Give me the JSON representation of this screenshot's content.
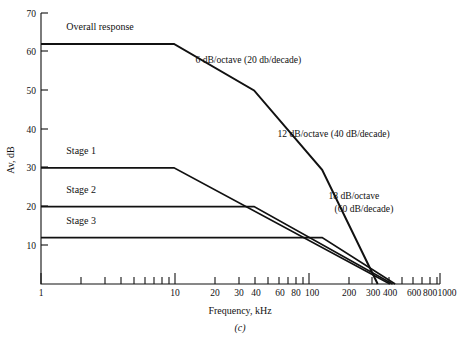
{
  "figure": {
    "caption": "(c)",
    "xlabel": "Frequency, kHz",
    "ylabel": "Av, dB"
  },
  "chart_data": {
    "type": "line",
    "title": "",
    "xlabel": "Frequency, kHz",
    "ylabel": "Av, dB",
    "xscale": "log",
    "xlim": [
      1,
      1000
    ],
    "ylim": [
      0,
      70
    ],
    "grid": false,
    "legend": "inline-labels",
    "xticks_major": [
      1,
      10,
      100,
      1000
    ],
    "xtick_labels": [
      "1",
      "10",
      "20",
      "30",
      "40",
      "60",
      "80",
      "100",
      "200",
      "300",
      "400",
      "600",
      "800",
      "1000"
    ],
    "xtick_values": [
      1,
      10,
      20,
      30,
      40,
      60,
      80,
      100,
      200,
      300,
      400,
      600,
      800,
      1000
    ],
    "xticks_minor": [
      2,
      3,
      4,
      5,
      6,
      7,
      8,
      9,
      20,
      30,
      40,
      50,
      60,
      70,
      80,
      90,
      200,
      300,
      400,
      500,
      600,
      700,
      800,
      900
    ],
    "ytick_values": [
      10,
      20,
      30,
      40,
      50,
      60,
      70
    ],
    "ytick_labels": [
      "10",
      "20",
      "30",
      "40",
      "50",
      "60",
      "70"
    ],
    "series": [
      {
        "name": "Overall response",
        "label": "Overall response",
        "label_x_khz": 1.55,
        "label_y_db": 65.5,
        "points": [
          {
            "f_khz": 1,
            "db": 62
          },
          {
            "f_khz": 10,
            "db": 62
          },
          {
            "f_khz": 40,
            "db": 50
          },
          {
            "f_khz": 130,
            "db": 29.5
          },
          {
            "f_khz": 340,
            "db": 0
          }
        ]
      },
      {
        "name": "Stage 1",
        "label": "Stage 1",
        "label_x_khz": 1.55,
        "label_y_db": 33.5,
        "points": [
          {
            "f_khz": 1,
            "db": 30
          },
          {
            "f_khz": 10,
            "db": 30
          },
          {
            "f_khz": 420,
            "db": 0
          }
        ]
      },
      {
        "name": "Stage 2",
        "label": "Stage 2",
        "label_x_khz": 1.55,
        "label_y_db": 23.5,
        "points": [
          {
            "f_khz": 1,
            "db": 20
          },
          {
            "f_khz": 40,
            "db": 20
          },
          {
            "f_khz": 440,
            "db": 0
          }
        ]
      },
      {
        "name": "Stage 3",
        "label": "Stage 3",
        "label_x_khz": 1.55,
        "label_y_db": 15.5,
        "points": [
          {
            "f_khz": 1,
            "db": 12
          },
          {
            "f_khz": 130,
            "db": 12
          },
          {
            "f_khz": 460,
            "db": 0
          }
        ]
      }
    ],
    "annotations": [
      {
        "id": "slope-6db",
        "text": "6 dB/octave (20 db/decade)",
        "lines": [
          "6 dB/octave (20 db/decade)"
        ],
        "x_khz": 14.5,
        "y_db": 57
      },
      {
        "id": "slope-12db",
        "text": "12 dB/octave (40 dB/decade)",
        "lines": [
          "12 dB/octave (40 dB/decade)"
        ],
        "x_khz": 60,
        "y_db": 38
      },
      {
        "id": "slope-18db",
        "text": "18 dB/octave (60 dB/decade)",
        "lines": [
          "18 dB/octave",
          "(60 dB/decade)"
        ],
        "x_khz": 145,
        "y_db": 22
      }
    ]
  }
}
